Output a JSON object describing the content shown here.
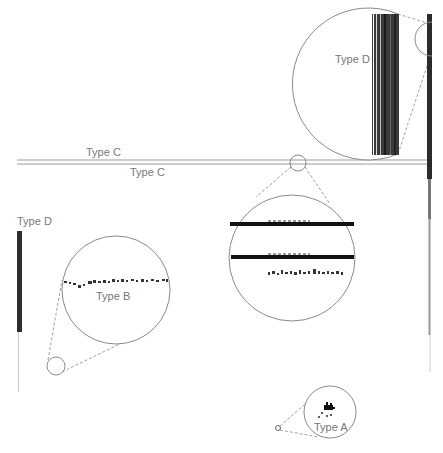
{
  "figure": {
    "labels": {
      "type_a": "Type A",
      "type_b": "Type B",
      "type_c_top": "Type C",
      "type_c_bottom": "Type C",
      "type_d_left": "Type D",
      "type_d_inset": "Type D"
    },
    "colors": {
      "background": "#ffffff",
      "outline": "#8a8a8a",
      "dark_mark": "#1a1a1a",
      "label": "#777777"
    },
    "insets": [
      {
        "id": "type-d-inset",
        "label": "Type D",
        "cx": 378,
        "cy": 88,
        "r": 76,
        "source": {
          "cx": 432,
          "cy": 40,
          "r": 17
        }
      },
      {
        "id": "type-c-inset",
        "label": "",
        "cx": 292,
        "cy": 258,
        "r": 63,
        "source": {
          "cx": 298,
          "cy": 163,
          "r": 8
        }
      },
      {
        "id": "type-b-inset",
        "label": "Type B",
        "cx": 116,
        "cy": 290,
        "r": 54,
        "source": {
          "cx": 56,
          "cy": 366,
          "r": 9
        }
      },
      {
        "id": "type-a-inset",
        "label": "Type A",
        "cx": 330,
        "cy": 412,
        "r": 26,
        "source": {
          "cx": 278,
          "cy": 428,
          "r": 3
        }
      }
    ]
  }
}
